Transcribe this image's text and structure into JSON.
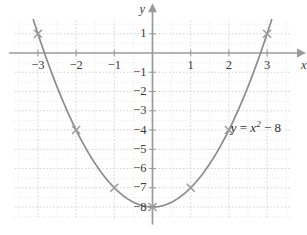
{
  "figure": {
    "kind": "cartesian-graph",
    "background_color": "#ffffff",
    "curve_color": "#8c8c8c",
    "axis_color": "#9a9a9a",
    "grid_color": "#c9c9c9",
    "grid_minor_color": "#dedede",
    "marker_color": "#9a9a9a",
    "text_color": "#3a3a3a"
  },
  "axes": {
    "x_name": "x",
    "y_name": "y",
    "x_ticks": [
      {
        "value": -3,
        "label": "−3"
      },
      {
        "value": -2,
        "label": "−2"
      },
      {
        "value": -1,
        "label": "−1"
      },
      {
        "value": 1,
        "label": "1"
      },
      {
        "value": 2,
        "label": "2"
      },
      {
        "value": 3,
        "label": "3"
      }
    ],
    "y_ticks": [
      {
        "value": 1,
        "label": "1"
      },
      {
        "value": -1,
        "label": "−1"
      },
      {
        "value": -2,
        "label": "−2"
      },
      {
        "value": -3,
        "label": "−3"
      },
      {
        "value": -4,
        "label": "−4"
      },
      {
        "value": -5,
        "label": "−5"
      },
      {
        "value": -6,
        "label": "−6"
      },
      {
        "value": -7,
        "label": "−7"
      },
      {
        "value": -8,
        "label": "−8"
      }
    ]
  },
  "equation": {
    "lhs": "y",
    "equals": "=",
    "base": "x",
    "exponent": "2",
    "minus": "−",
    "constant": "8",
    "full_text": "y = x² − 8"
  },
  "chart_data": {
    "type": "line",
    "title": "",
    "subtitle": "",
    "xlabel": "x",
    "ylabel": "y",
    "xlim": [
      -3.6,
      3.6
    ],
    "ylim": [
      -8.6,
      1.7
    ],
    "grid": true,
    "grid_step_major": 1,
    "grid_step_minor": 0.5,
    "legend": "y = x² − 8",
    "legend_position": "inside-right",
    "annotations": [
      {
        "text": "y = x² − 8",
        "x": 2.1,
        "y": -3.85
      }
    ],
    "series": [
      {
        "name": "y = x^2 - 8",
        "function": "x^2 - 8",
        "marked_points": [
          {
            "x": -3,
            "y": 1
          },
          {
            "x": -2,
            "y": -4
          },
          {
            "x": -1,
            "y": -7
          },
          {
            "x": 0,
            "y": -8
          },
          {
            "x": 1,
            "y": -7
          },
          {
            "x": 2,
            "y": -4
          },
          {
            "x": 3,
            "y": 1
          }
        ],
        "x": [
          -3,
          -2.75,
          -2.5,
          -2.25,
          -2,
          -1.75,
          -1.5,
          -1.25,
          -1,
          -0.75,
          -0.5,
          -0.25,
          0,
          0.25,
          0.5,
          0.75,
          1,
          1.25,
          1.5,
          1.75,
          2,
          2.25,
          2.5,
          2.75,
          3
        ],
        "values": [
          1,
          -0.4375,
          -1.75,
          -2.9375,
          -4,
          -4.9375,
          -5.75,
          -6.4375,
          -7,
          -7.4375,
          -7.75,
          -7.9375,
          -8,
          -7.9375,
          -7.75,
          -7.4375,
          -7,
          -6.4375,
          -5.75,
          -4.9375,
          -4,
          -2.9375,
          -1.75,
          -0.4375,
          1
        ]
      }
    ]
  }
}
